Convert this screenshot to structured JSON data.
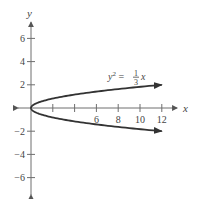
{
  "chart_data": {
    "type": "line",
    "title": "",
    "xlabel": "x",
    "ylabel": "y",
    "xlim": [
      -1,
      13
    ],
    "ylim": [
      -7,
      7
    ],
    "x_ticks": [
      2,
      4,
      6,
      8,
      10,
      12
    ],
    "x_tick_labels": [
      "",
      "",
      "6",
      "8",
      "10",
      "12"
    ],
    "y_ticks": [
      -6,
      -4,
      -2,
      2,
      4,
      6
    ],
    "y_tick_labels": [
      "-6",
      "-4",
      "-2",
      "2",
      "4",
      "6"
    ],
    "grid": false,
    "annotation": {
      "text_lhs": "y² = ",
      "frac_num": "1",
      "frac_den": "3",
      "text_rhs": "x"
    },
    "series": [
      {
        "name": "y^2 = (1/3)x (upper branch)",
        "equation": "y = sqrt(x/3)",
        "x": [
          0,
          0.75,
          3,
          6.75,
          12
        ],
        "y": [
          0,
          0.5,
          1,
          1.5,
          2
        ]
      },
      {
        "name": "y^2 = (1/3)x (lower branch)",
        "equation": "y = -sqrt(x/3)",
        "x": [
          0,
          0.75,
          3,
          6.75,
          12
        ],
        "y": [
          0,
          -0.5,
          -1,
          -1.5,
          -2
        ]
      }
    ]
  }
}
